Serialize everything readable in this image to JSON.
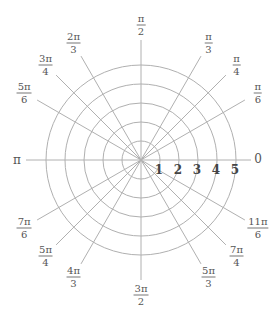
{
  "diagram": {
    "center": {
      "x": 141,
      "y": 160
    },
    "ring_spacing_px": 19,
    "rings": [
      1,
      2,
      3,
      4,
      5
    ],
    "ray_length_px": 120,
    "colors": {
      "grid": "#b0b0b0",
      "label": "#555555",
      "radial_label": "#444444"
    },
    "axis_labels": {
      "zero": "0",
      "pi": "π"
    },
    "angle_labels": [
      {
        "deg": 30,
        "num": "π",
        "den": "6"
      },
      {
        "deg": 45,
        "num": "π",
        "den": "4"
      },
      {
        "deg": 60,
        "num": "π",
        "den": "3"
      },
      {
        "deg": 90,
        "num": "π",
        "den": "2"
      },
      {
        "deg": 120,
        "num": "2π",
        "den": "3"
      },
      {
        "deg": 135,
        "num": "3π",
        "den": "4"
      },
      {
        "deg": 150,
        "num": "5π",
        "den": "6"
      },
      {
        "deg": 210,
        "num": "7π",
        "den": "6"
      },
      {
        "deg": 225,
        "num": "5π",
        "den": "4"
      },
      {
        "deg": 240,
        "num": "4π",
        "den": "3"
      },
      {
        "deg": 270,
        "num": "3π",
        "den": "2"
      },
      {
        "deg": 300,
        "num": "5π",
        "den": "3"
      },
      {
        "deg": 315,
        "num": "7π",
        "den": "4"
      },
      {
        "deg": 330,
        "num": "11π",
        "den": "6"
      }
    ],
    "radial_labels": [
      "1",
      "2",
      "3",
      "4",
      "5"
    ]
  }
}
